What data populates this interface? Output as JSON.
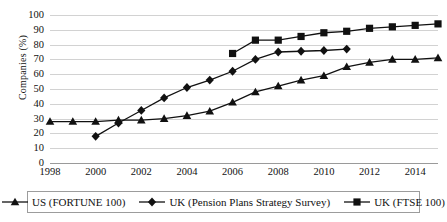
{
  "chart_data": {
    "type": "line",
    "title": "",
    "xlabel": "",
    "ylabel": "Companies (%)",
    "xlim": [
      1998,
      2015
    ],
    "ylim": [
      0,
      100
    ],
    "grid": true,
    "legend_position": "bottom",
    "y_ticks": [
      100,
      90,
      80,
      70,
      60,
      50,
      40,
      30,
      20,
      10,
      0
    ],
    "x_ticks": [
      1998,
      2000,
      2002,
      2004,
      2006,
      2008,
      2010,
      2012,
      2014
    ],
    "series": [
      {
        "name": "US (FORTUNE 100)",
        "marker": "triangle",
        "color": "#111111",
        "x": [
          1998,
          1999,
          2000,
          2001,
          2002,
          2003,
          2004,
          2005,
          2006,
          2007,
          2008,
          2009,
          2010,
          2011,
          2012,
          2013,
          2014,
          2015
        ],
        "values": [
          28,
          28,
          28,
          29,
          29,
          30,
          32,
          35,
          41,
          48,
          52,
          56,
          59,
          65,
          68,
          70,
          70,
          71
        ]
      },
      {
        "name": "UK (Pension Plans Strategy Survey)",
        "marker": "diamond",
        "color": "#111111",
        "x": [
          2000,
          2001,
          2002,
          2003,
          2004,
          2005,
          2006,
          2007,
          2008,
          2009,
          2010,
          2011
        ],
        "values": [
          18,
          27,
          35.5,
          44,
          51,
          56,
          62,
          70,
          75,
          75.5,
          76,
          77
        ]
      },
      {
        "name": "UK (FTSE 100)",
        "marker": "square",
        "color": "#111111",
        "x": [
          2006,
          2007,
          2008,
          2009,
          2010,
          2011,
          2012,
          2013,
          2014,
          2015
        ],
        "values": [
          74,
          83,
          83,
          85.5,
          88,
          89,
          91,
          92,
          93,
          94
        ]
      }
    ]
  }
}
